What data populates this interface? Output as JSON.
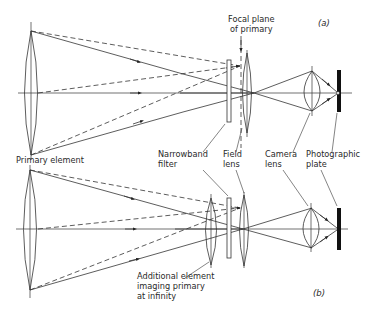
{
  "figure": {
    "panels": [
      {
        "id": "a",
        "tag": "(a)",
        "labels": {
          "focal_plane_line1": "Focal plane",
          "focal_plane_line2": "of primary",
          "primary_element": "Primary element"
        }
      },
      {
        "id": "b",
        "tag": "(b)",
        "labels": {
          "additional_line1": "Additional element",
          "additional_line2": "imaging primary",
          "additional_line3": "at infinity"
        }
      }
    ],
    "shared_labels": {
      "narrowband_line1": "Narrowband",
      "narrowband_line2": "filter",
      "field_line1": "Field",
      "field_line2": "lens",
      "camera_line1": "Camera",
      "camera_line2": "lens",
      "plate_line1": "Photographic",
      "plate_line2": "plate"
    },
    "components": [
      "Primary element",
      "Narrowband filter",
      "Field lens",
      "Camera lens",
      "Photographic plate",
      "Additional element imaging primary at infinity"
    ]
  }
}
